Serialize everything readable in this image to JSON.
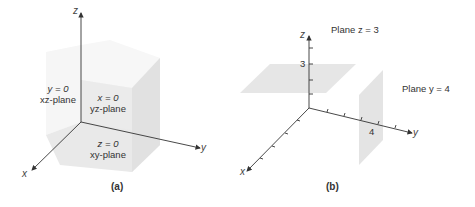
{
  "panel_a": {
    "caption": "(a)",
    "axes": {
      "x": "x",
      "y": "y",
      "z": "z"
    },
    "planes": [
      {
        "eq": "y = 0",
        "name": "xz-plane"
      },
      {
        "eq": "x = 0",
        "name": "yz-plane"
      },
      {
        "eq": "z = 0",
        "name": "xy-plane"
      }
    ]
  },
  "panel_b": {
    "caption": "(b)",
    "axes": {
      "x": "x",
      "y": "y",
      "z": "z"
    },
    "tick_labels": {
      "z": "3",
      "y": "4"
    },
    "plane_labels": [
      "Plane z = 3",
      "Plane y = 4"
    ]
  },
  "colors": {
    "face_light": "#f4f4f4",
    "face_mid": "#ececec",
    "face_dark": "#e2e2e2",
    "plane": "#e4e4e4",
    "axis": "#333333"
  }
}
